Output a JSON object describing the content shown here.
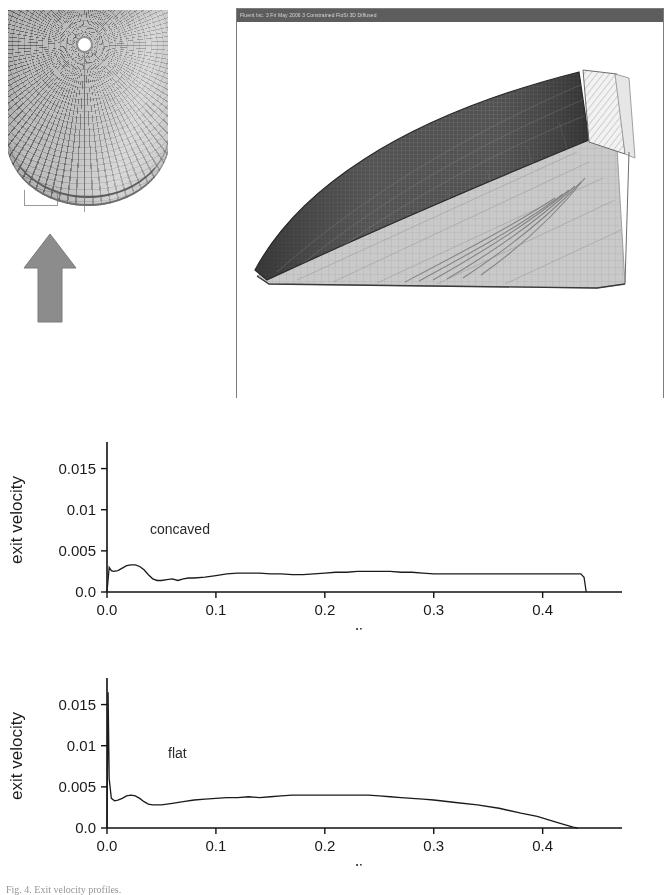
{
  "figure": {
    "caption": "Fig. 4. Exit velocity profiles."
  },
  "mesh_photo": {
    "label": "radial-mesh-disc-photograph",
    "arrow_label": "flow-direction-arrow",
    "arrow_color": "#8c8c8c",
    "disc_color": "#b9b9b9"
  },
  "cfd_window": {
    "titlebar_text": "Fluent Inc. 3 Fri  May 2006  3  Constrained FloSi 3D  Diffused",
    "titlebar_color": "#5d5d5d",
    "canvas_label": "3d-sector-mesh-view"
  },
  "chart_data": [
    {
      "id": "concaved",
      "type": "line",
      "title": "",
      "xlabel": "radius",
      "ylabel": "exit velocity",
      "annotation": "concaved",
      "xlim": [
        0.0,
        0.46
      ],
      "ylim": [
        0.0,
        0.0175
      ],
      "xticks": [
        0.0,
        0.1,
        0.2,
        0.3,
        0.4
      ],
      "xticklabels": [
        "0.0",
        "0.1",
        "0.2",
        "0.3",
        "0.4"
      ],
      "yticks": [
        0.0,
        0.005,
        0.01,
        0.015
      ],
      "yticklabels": [
        "0.0",
        "0.005",
        "0.01",
        "0.015"
      ],
      "grid": false,
      "legend": "none",
      "x": [
        0.0,
        0.002,
        0.004,
        0.006,
        0.01,
        0.014,
        0.018,
        0.022,
        0.026,
        0.03,
        0.034,
        0.038,
        0.042,
        0.046,
        0.05,
        0.055,
        0.06,
        0.065,
        0.07,
        0.075,
        0.08,
        0.09,
        0.1,
        0.11,
        0.12,
        0.13,
        0.14,
        0.15,
        0.16,
        0.17,
        0.18,
        0.19,
        0.2,
        0.21,
        0.22,
        0.23,
        0.24,
        0.25,
        0.26,
        0.27,
        0.28,
        0.29,
        0.3,
        0.32,
        0.34,
        0.36,
        0.38,
        0.4,
        0.42,
        0.435,
        0.438,
        0.44
      ],
      "y": [
        0.0,
        0.003,
        0.0026,
        0.0025,
        0.0026,
        0.0029,
        0.0032,
        0.0033,
        0.0033,
        0.0031,
        0.0027,
        0.0021,
        0.0016,
        0.0014,
        0.0014,
        0.0015,
        0.0016,
        0.0014,
        0.0016,
        0.0017,
        0.0017,
        0.0018,
        0.002,
        0.0022,
        0.0023,
        0.0023,
        0.0023,
        0.0022,
        0.0022,
        0.0021,
        0.0021,
        0.0022,
        0.0023,
        0.0024,
        0.0024,
        0.0025,
        0.0025,
        0.0025,
        0.0025,
        0.0024,
        0.0024,
        0.0023,
        0.0022,
        0.0022,
        0.0022,
        0.0022,
        0.0022,
        0.0022,
        0.0022,
        0.0022,
        0.0018,
        0.0
      ]
    },
    {
      "id": "flat",
      "type": "line",
      "title": "",
      "xlabel": "radius",
      "ylabel": "exit velocity",
      "annotation": "flat",
      "xlim": [
        0.0,
        0.46
      ],
      "ylim": [
        0.0,
        0.0175
      ],
      "xticks": [
        0.0,
        0.1,
        0.2,
        0.3,
        0.4
      ],
      "xticklabels": [
        "0.0",
        "0.1",
        "0.2",
        "0.3",
        "0.4"
      ],
      "yticks": [
        0.0,
        0.005,
        0.01,
        0.015
      ],
      "yticklabels": [
        "0.0",
        "0.005",
        "0.01",
        "0.015"
      ],
      "grid": false,
      "legend": "none",
      "x": [
        0.0,
        0.001,
        0.002,
        0.004,
        0.007,
        0.01,
        0.014,
        0.018,
        0.022,
        0.026,
        0.03,
        0.034,
        0.038,
        0.042,
        0.046,
        0.05,
        0.055,
        0.06,
        0.07,
        0.08,
        0.09,
        0.1,
        0.11,
        0.12,
        0.13,
        0.14,
        0.15,
        0.16,
        0.17,
        0.18,
        0.19,
        0.2,
        0.21,
        0.22,
        0.23,
        0.24,
        0.25,
        0.26,
        0.27,
        0.28,
        0.29,
        0.3,
        0.32,
        0.34,
        0.36,
        0.38,
        0.395,
        0.41,
        0.42,
        0.428,
        0.432
      ],
      "y": [
        0.0,
        0.0165,
        0.006,
        0.0036,
        0.0033,
        0.0034,
        0.0036,
        0.0039,
        0.004,
        0.0039,
        0.0036,
        0.0032,
        0.0029,
        0.0028,
        0.0028,
        0.0028,
        0.0029,
        0.003,
        0.0032,
        0.0034,
        0.0035,
        0.0036,
        0.0037,
        0.0037,
        0.0038,
        0.0037,
        0.0038,
        0.0039,
        0.004,
        0.004,
        0.004,
        0.004,
        0.004,
        0.004,
        0.004,
        0.004,
        0.0039,
        0.0038,
        0.0037,
        0.0036,
        0.0035,
        0.0034,
        0.0031,
        0.0028,
        0.0024,
        0.0018,
        0.0014,
        0.0008,
        0.0004,
        0.0001,
        0.0
      ]
    }
  ]
}
